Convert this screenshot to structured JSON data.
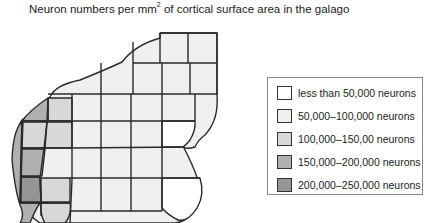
{
  "title": {
    "prefix": "Neuron numbers per mm",
    "superscript": "2",
    "suffix": " of cortical surface area in the galago"
  },
  "colors": {
    "outline": "#2a2a2a",
    "less_than_50k": "#ffffff",
    "50k_100k": "#f0f0f0",
    "100k_150k": "#d8d8d8",
    "150k_200k": "#b0b0b0",
    "200k_250k": "#959595"
  },
  "legend": {
    "items": [
      {
        "label": "less than 50,000 neurons",
        "color": "#ffffff"
      },
      {
        "label": "50,000–100,000 neurons",
        "color": "#f0f0f0"
      },
      {
        "label": "100,000–150,00 neurons",
        "color": "#d8d8d8"
      },
      {
        "label": "150,000–200,000 neurons",
        "color": "#b0b0b0"
      },
      {
        "label": "200,000–250,000 neurons",
        "color": "#959595"
      }
    ]
  }
}
